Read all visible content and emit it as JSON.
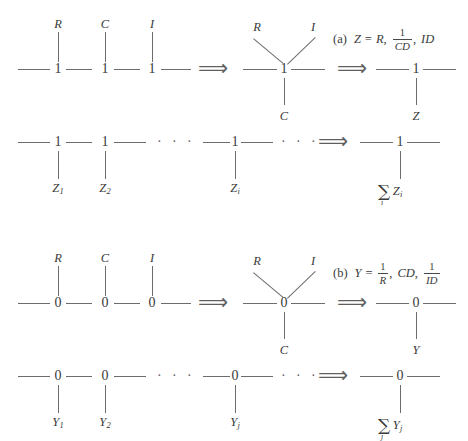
{
  "figure": {
    "background": "#ffffff",
    "ink": "#3a3a3a",
    "line_color": "#6c6c6c"
  },
  "glyphs": {
    "implies": "⟹",
    "ellipsis": "· · ·",
    "sigma": "∑"
  },
  "parts": {
    "a": {
      "junction_symbol": "1",
      "formula": {
        "tag": "(a)",
        "lhs": "Z",
        "equals": "=",
        "terms": [
          "R",
          "1/CD",
          "ID"
        ],
        "term1": "R",
        "term2_num": "1",
        "term2_den": "CD",
        "term3": "ID",
        "comma": ","
      },
      "row1": {
        "source_labels": [
          "R",
          "C",
          "I"
        ],
        "merged_diagonal_labels": [
          "R",
          "I"
        ],
        "merged_bottom_label": "C",
        "result_label": "Z"
      },
      "row2": {
        "labels": [
          "Z",
          "Z",
          "Z"
        ],
        "subscripts": [
          "1",
          "2",
          "i"
        ],
        "sum_index": "i",
        "sum_term": "Z",
        "sum_subscript": "i"
      }
    },
    "b": {
      "junction_symbol": "0",
      "formula": {
        "tag": "(b)",
        "lhs": "Y",
        "equals": "=",
        "terms": [
          "1/R",
          "CD",
          "1/ID"
        ],
        "term1_num": "1",
        "term1_den": "R",
        "term2": "CD",
        "term3_num": "1",
        "term3_den": "ID",
        "comma": ","
      },
      "row1": {
        "source_labels": [
          "R",
          "C",
          "I"
        ],
        "merged_diagonal_labels": [
          "R",
          "I"
        ],
        "merged_bottom_label": "C",
        "result_label": "Y"
      },
      "row2": {
        "labels": [
          "Y",
          "Y",
          "Y"
        ],
        "subscripts": [
          "1",
          "2",
          "j"
        ],
        "sum_index": "j",
        "sum_term": "Y",
        "sum_subscript": "j"
      }
    }
  }
}
